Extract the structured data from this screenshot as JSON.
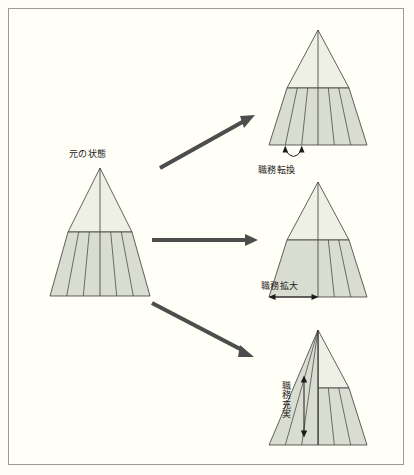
{
  "diagram": {
    "title_present": false,
    "background_color": "#fffef7",
    "border_color": "#9a9a96",
    "fill_light": "#eef0e6",
    "fill_dark": "#d9dcd0",
    "stroke_color": "#3a3a3a",
    "arrow_color": "#4d4d4d",
    "labels": {
      "original_state": "元の状態",
      "job_rotation": "職務転換",
      "job_enlargement": "職務拡大",
      "job_enrichment": "職務充実"
    },
    "icons": {
      "diagonal_arrow_up": "arrow-up-right-icon",
      "horizontal_arrow": "arrow-right-icon",
      "diagonal_arrow_down": "arrow-down-right-icon",
      "curved_double_arrow": "curved-double-arrow-icon",
      "horizontal_double_arrow": "horizontal-double-arrow-icon",
      "vertical_double_arrow": "vertical-double-arrow-icon"
    },
    "nodes": [
      {
        "id": "original",
        "label": "元の状態",
        "segments": 6,
        "upper_unsegmented": true
      },
      {
        "id": "rotation",
        "label": "職務転換",
        "segments": 6,
        "upper_unsegmented": true
      },
      {
        "id": "enlargement",
        "label": "職務拡大",
        "segments": 4,
        "upper_unsegmented": true
      },
      {
        "id": "enrichment",
        "label": "職務充実",
        "segments": 6,
        "upper_unsegmented": false
      }
    ]
  }
}
